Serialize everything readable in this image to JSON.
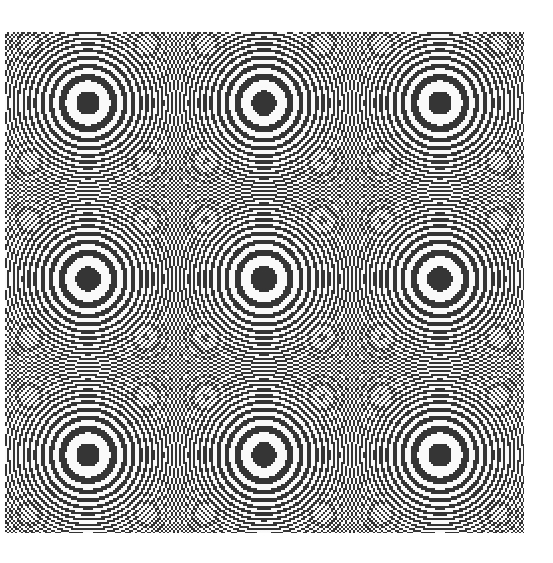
{
  "image": {
    "description": "Binary moire zone-plate pattern",
    "canvas_size": [
      553,
      563
    ],
    "background": "#ffffff",
    "pattern": {
      "box": {
        "left": 5,
        "top": 32,
        "width": 519,
        "height": 501
      },
      "center": {
        "x": 264,
        "y": 279
      },
      "function": "cos(a*(x^2+y^2)) sampled on grid of step s, thresholded",
      "a": 0.00893,
      "sample_step_px": 2,
      "dark_color": "#353535",
      "light_color": "#fafafa",
      "features": {
        "central_ring_center": [
          264,
          279
        ],
        "satellite_ring_centers": [
          [
            175,
            191
          ],
          [
            353,
            191
          ],
          [
            175,
            367
          ],
          [
            353,
            367
          ]
        ],
        "saddle_points": [
          [
            264,
            190
          ],
          [
            176,
            279
          ],
          [
            352,
            279
          ],
          [
            264,
            366
          ]
        ]
      }
    }
  }
}
